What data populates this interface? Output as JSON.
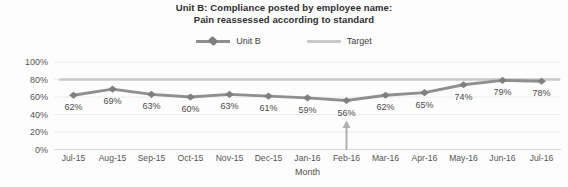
{
  "chart": {
    "title_line1": "Unit B: Compliance posted by employee name:",
    "title_line2": "Pain reassessed according to standard",
    "xlabel": "Month",
    "colors": {
      "series_line": "#8f8f8f",
      "series_marker": "#7f7f7f",
      "target_line": "#c9c9c9",
      "gridline": "#ececec",
      "axis_line": "#d6d6d6",
      "data_label_text": "#4a4a4a",
      "axis_text": "#555555",
      "title_text": "#2e2e2e",
      "arrow": "#b0b0b0"
    }
  },
  "chart_data": {
    "type": "line",
    "title": "Unit B: Compliance posted by employee name: Pain reassessed according to standard",
    "xlabel": "Month",
    "ylabel": "",
    "ylim": [
      0,
      100
    ],
    "ytick_values": [
      0,
      20,
      40,
      60,
      80,
      100
    ],
    "ytick_labels": [
      "0%",
      "20%",
      "40%",
      "60%",
      "80%",
      "100%"
    ],
    "grid": true,
    "legend_position": "top",
    "categories": [
      "Jul-15",
      "Aug-15",
      "Sep-15",
      "Oct-15",
      "Nov-15",
      "Dec-15",
      "Jan-16",
      "Feb-16",
      "Mar-16",
      "Apr-16",
      "May-16",
      "Jun-16",
      "Jul-16"
    ],
    "series": [
      {
        "name": "Unit B",
        "type": "line-with-markers",
        "values": [
          62,
          69,
          63,
          60,
          63,
          61,
          59,
          56,
          62,
          65,
          74,
          79,
          78
        ],
        "data_labels": [
          "62%",
          "69%",
          "63%",
          "60%",
          "63%",
          "61%",
          "59%",
          "56%",
          "62%",
          "65%",
          "74%",
          "79%",
          "78%"
        ]
      },
      {
        "name": "Target",
        "type": "constant-line",
        "value": 80
      }
    ],
    "annotations": [
      {
        "type": "up-arrow",
        "category": "Feb-16",
        "index": 7
      }
    ]
  }
}
